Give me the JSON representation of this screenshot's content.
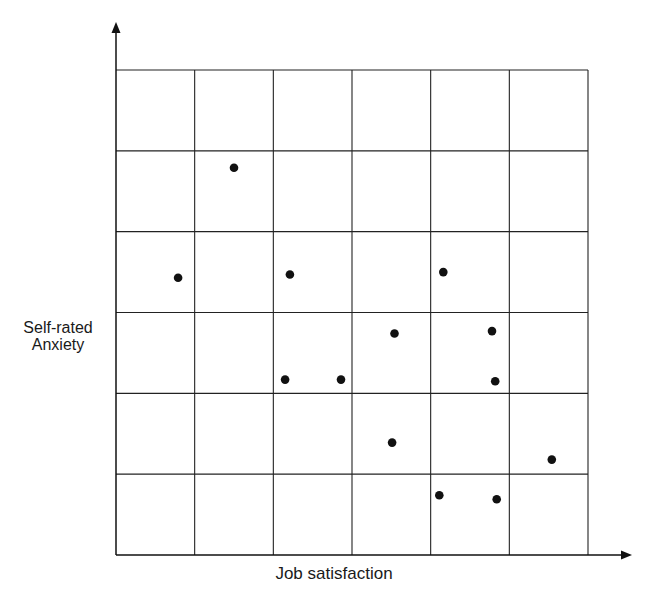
{
  "chart_data": {
    "type": "scatter",
    "title": "",
    "xlabel": "Job satisfaction",
    "ylabel_lines": [
      "Self-rated",
      "Anxiety"
    ],
    "ylabel": "Self-rated Anxiety",
    "grid": true,
    "grid_divisions": {
      "x": 6,
      "y": 6
    },
    "xlim": [
      0,
      6
    ],
    "ylim": [
      0,
      6
    ],
    "tick_labels": {
      "x": [],
      "y": []
    },
    "legend": null,
    "marker_color": "#111111",
    "line_color": "#222222",
    "points": [
      {
        "x": 1.5,
        "y": 4.79
      },
      {
        "x": 0.79,
        "y": 3.43
      },
      {
        "x": 2.21,
        "y": 3.47
      },
      {
        "x": 4.16,
        "y": 3.5
      },
      {
        "x": 3.54,
        "y": 2.74
      },
      {
        "x": 4.78,
        "y": 2.77
      },
      {
        "x": 2.15,
        "y": 2.17
      },
      {
        "x": 2.86,
        "y": 2.17
      },
      {
        "x": 4.82,
        "y": 2.15
      },
      {
        "x": 3.51,
        "y": 1.39
      },
      {
        "x": 5.54,
        "y": 1.18
      },
      {
        "x": 4.11,
        "y": 0.74
      },
      {
        "x": 4.84,
        "y": 0.69
      }
    ]
  },
  "layout": {
    "plot_left": 116,
    "plot_right": 588,
    "plot_top": 70,
    "plot_bottom": 555,
    "y_axis_arrow_top": 22,
    "x_axis_arrow_right": 632,
    "marker_radius": 4.3
  }
}
